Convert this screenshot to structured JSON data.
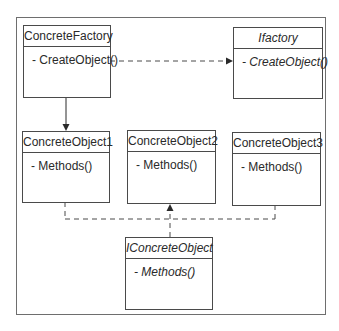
{
  "diagram": {
    "type": "uml-class-diagram",
    "classes": [
      {
        "id": "concrete_factory",
        "name": "ConcreteFactory",
        "members": [
          "- CreateObject()"
        ],
        "abstract": false
      },
      {
        "id": "ifactory",
        "name": "Ifactory",
        "members": [
          "- CreateObject()"
        ],
        "abstract": true
      },
      {
        "id": "concrete_object1",
        "name": "ConcreteObject1",
        "members": [
          "- Methods()"
        ],
        "abstract": false
      },
      {
        "id": "concrete_object2",
        "name": "ConcreteObject2",
        "members": [
          "- Methods()"
        ],
        "abstract": false
      },
      {
        "id": "concrete_object3",
        "name": "ConcreteObject3",
        "members": [
          "- Methods()"
        ],
        "abstract": false
      },
      {
        "id": "iconcrete_object",
        "name": "IConcreteObject",
        "members": [
          "- Methods()"
        ],
        "abstract": true
      }
    ],
    "relations": [
      {
        "from": "ConcreteFactory",
        "to": "Ifactory",
        "style": "dashed",
        "arrow": "filled"
      },
      {
        "from": "ConcreteFactory",
        "to": "ConcreteObject1",
        "style": "solid",
        "arrow": "filled"
      },
      {
        "from": "IConcreteObject",
        "to": "ConcreteObject2",
        "style": "dashed",
        "arrow": "filled"
      },
      {
        "from": "ConcreteObject1",
        "to": "IConcreteObject",
        "style": "dashed",
        "arrow": "none"
      },
      {
        "from": "ConcreteObject3",
        "to": "IConcreteObject",
        "style": "dashed",
        "arrow": "none"
      }
    ],
    "colors": {
      "line": "#4a4a4a",
      "frame": "#6e6e6e",
      "background": "#ffffff"
    }
  }
}
